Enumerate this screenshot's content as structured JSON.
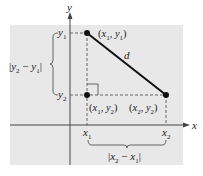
{
  "colors": {
    "background": "#e8e8e8",
    "axis": "#444444",
    "segment": "#111111",
    "dashed": "#444444",
    "text": "#222222"
  },
  "axes": {
    "x_label": "x",
    "y_label": "y"
  },
  "ticks": {
    "x1": {
      "base": "x",
      "sub": "1"
    },
    "x2": {
      "base": "x",
      "sub": "2"
    },
    "y1": {
      "base": "y",
      "sub": "1"
    },
    "y2": {
      "base": "y",
      "sub": "2"
    }
  },
  "points": {
    "p1": {
      "label_parts": [
        "(",
        "x",
        "1",
        ", ",
        "y",
        "1",
        ")"
      ]
    },
    "p2": {
      "label_parts": [
        "(",
        "x",
        "2",
        ", ",
        "y",
        "2",
        ")"
      ]
    },
    "corner": {
      "label_parts": [
        "(",
        "x",
        "1",
        ", ",
        "y",
        "2",
        ")"
      ]
    }
  },
  "segment_label": "d",
  "brace_labels": {
    "horizontal": {
      "parts": [
        "|",
        "x",
        "2",
        " − ",
        "x",
        "1",
        "|"
      ]
    },
    "vertical": {
      "parts": [
        "|",
        "y",
        "2",
        " − ",
        "y",
        "1",
        "|"
      ]
    }
  }
}
